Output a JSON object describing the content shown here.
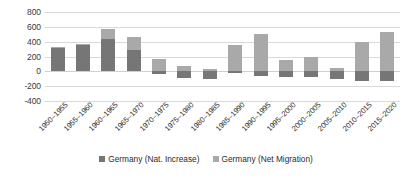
{
  "chart_data": {
    "type": "bar",
    "subtype": "stacked-bar",
    "title": "",
    "subtitle": "",
    "xlabel": "",
    "ylabel": "",
    "ylim": [
      -400,
      800
    ],
    "ytick_step": 200,
    "yticks": [
      "800",
      "600",
      "400",
      "200",
      "0",
      "-200",
      "-400"
    ],
    "ytick_values": [
      800,
      600,
      400,
      200,
      0,
      -200,
      -400
    ],
    "grid": true,
    "grid_axis": "y",
    "legend_position": "bottom",
    "categories": [
      "1950–1955",
      "1955–1960",
      "1960–1965",
      "1965–1970",
      "1970–1975",
      "1975–1980",
      "1980–1985",
      "1985–1990",
      "1990–1995",
      "1995–2000",
      "2000–2005",
      "2005–2010",
      "2010–2015",
      "2015–2020"
    ],
    "series": [
      {
        "name": "Germany (Nat. Increase)",
        "color": "#767676",
        "values": [
          310,
          360,
          440,
          285,
          -40,
          -90,
          -105,
          -25,
          -60,
          -70,
          -75,
          -105,
          -130,
          -135
        ]
      },
      {
        "name": "Germany (Net Migration)",
        "color": "#a9a9a9",
        "values": [
          15,
          10,
          125,
          180,
          170,
          75,
          25,
          355,
          500,
          150,
          195,
          50,
          400,
          530
        ]
      }
    ]
  },
  "legend": {
    "items": [
      {
        "label": "Germany (Nat. Increase)",
        "color": "#767676",
        "swatch": "square-swatch-icon"
      },
      {
        "label": "Germany (Net Migration)",
        "color": "#a9a9a9",
        "swatch": "square-swatch-icon"
      }
    ]
  },
  "colors": {
    "nat_increase": "#767676",
    "net_migration": "#a9a9a9",
    "gridline": "#d9d9d9",
    "axis_text": "#3a3a3a",
    "background": "#ffffff"
  }
}
